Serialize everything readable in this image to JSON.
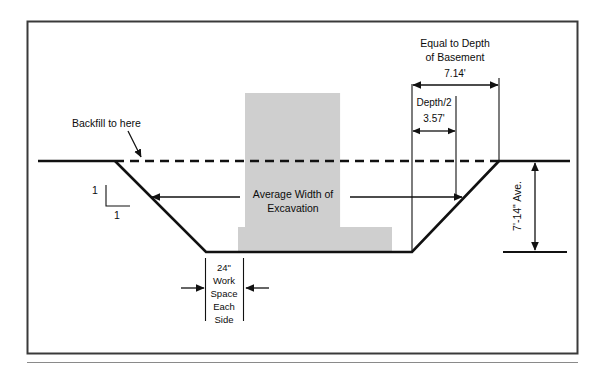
{
  "figure": {
    "colors": {
      "line": "#111111",
      "building_fill": "#cfcfcf",
      "frame": "#3a3a3a",
      "rule": "#8a8a8a",
      "text": "#0c0c0c"
    }
  },
  "labels": {
    "backfill": "Backfill to here",
    "slope_rise": "1",
    "slope_run": "1",
    "average_width_line1": "Average Width of",
    "average_width_line2": "Excavation",
    "equal_depth_line1": "Equal to Depth",
    "equal_depth_line2": "of Basement",
    "equal_depth_value": "7.14'",
    "half_depth_label": "Depth/2",
    "half_depth_value": "3.57'",
    "avg_depth": "7'-14\" Ave.",
    "workspace": [
      "24\"",
      "Work",
      "Space",
      "Each",
      "Side"
    ]
  },
  "dimensions": {
    "equal_to_depth_of_basement_ft": 7.14,
    "depth_over_2_ft": 3.57,
    "work_space_each_side_in": 24,
    "average_depth_range": "7'-14\"",
    "side_slope_ratio": "1:1"
  }
}
